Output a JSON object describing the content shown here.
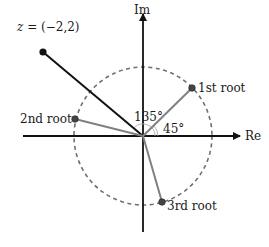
{
  "diagram": {
    "axes": {
      "real_label": "Re",
      "imag_label": "Im"
    },
    "point_z": {
      "label": "z = (−2,2)",
      "label_var": "z",
      "label_rest": " = (−2,2)",
      "coords": [
        -2,
        2
      ]
    },
    "roots": [
      {
        "label": "1st root",
        "angle_deg": 45
      },
      {
        "label": "2nd root",
        "angle_deg": 165
      },
      {
        "label": "3rd root",
        "angle_deg": 285
      }
    ],
    "angles": [
      {
        "label": "135°"
      },
      {
        "label": "45°"
      }
    ],
    "circle": {
      "style": "dashed"
    },
    "colors": {
      "axis": "#111111",
      "z_line": "#111111",
      "root_line": "#808080",
      "circle": "#707070",
      "root_dot": "#444444"
    }
  }
}
